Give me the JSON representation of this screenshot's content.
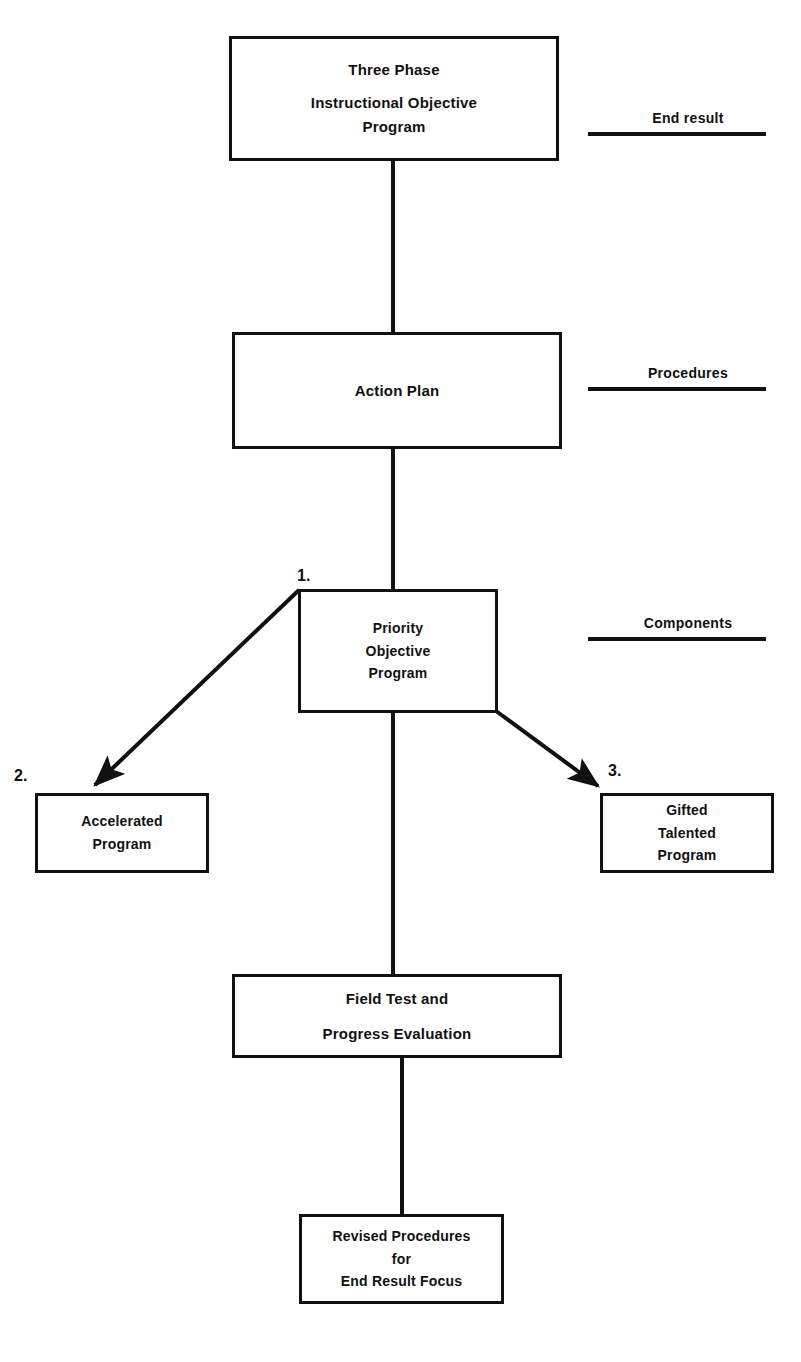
{
  "diagram": {
    "title": "Three Phase Instructional Objective Program",
    "colors": {
      "ink": "#111111",
      "paper": "#ffffff"
    },
    "nodes": {
      "top": {
        "id": "three-phase-instructional-objective-program",
        "lines": [
          "Three Phase",
          "Instructional Objective",
          "Program"
        ]
      },
      "action_plan": {
        "id": "action-plan",
        "lines": [
          "Action Plan"
        ]
      },
      "priority": {
        "id": "priority-objective-program",
        "step": "1.",
        "lines": [
          "Priority",
          "Objective",
          "Program"
        ]
      },
      "accelerated": {
        "id": "accelerated-program",
        "step": "2.",
        "lines": [
          "Accelerated",
          "Program"
        ]
      },
      "gifted": {
        "id": "gifted-talented-program",
        "step": "3.",
        "lines": [
          "Gifted",
          "Talented",
          "Program"
        ]
      },
      "field_test": {
        "id": "field-test-and-progress-evaluation",
        "lines": [
          "Field Test and",
          "Progress Evaluation"
        ]
      },
      "revised": {
        "id": "revised-procedures-for-end-result-focus",
        "lines": [
          "Revised Procedures",
          "for",
          "End Result Focus"
        ]
      }
    },
    "side_labels": [
      {
        "id": "end-result",
        "text": "End result"
      },
      {
        "id": "procedures",
        "text": "Procedures"
      },
      {
        "id": "components",
        "text": "Components"
      }
    ],
    "connectors": [
      {
        "id": "top-to-action-plan",
        "kind": "line"
      },
      {
        "id": "action-plan-to-priority",
        "kind": "line"
      },
      {
        "id": "priority-to-accelerated",
        "kind": "arrow"
      },
      {
        "id": "priority-to-gifted",
        "kind": "arrow"
      },
      {
        "id": "priority-to-field-test",
        "kind": "line"
      },
      {
        "id": "field-test-to-revised",
        "kind": "line"
      }
    ]
  }
}
